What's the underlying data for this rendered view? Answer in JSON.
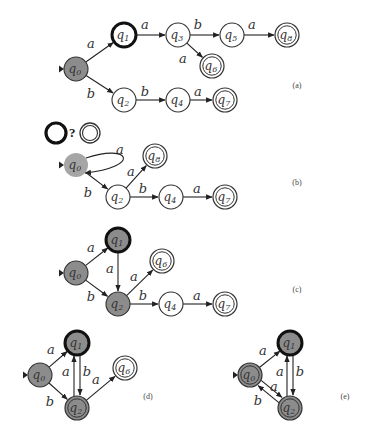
{
  "figure": {
    "colors": {
      "stroke": "#222222",
      "fill_white": "#ffffff",
      "fill_gray": "#8c8c8c",
      "fill_light_gray": "#a6a6a6",
      "text": "#333333"
    },
    "legend": {
      "thick_circle": "thick-bordered state",
      "question_mark": "?",
      "double_circle": "accepting state"
    },
    "panels": [
      {
        "id": "a",
        "label": "(a)",
        "label_pos": [
          297,
          88
        ],
        "nodes": [
          {
            "id": "q0",
            "name": "q",
            "sub": "0",
            "x": 76,
            "y": 69,
            "fill": "gray",
            "style": "normal",
            "initial": true
          },
          {
            "id": "q1",
            "name": "q",
            "sub": "1",
            "x": 124,
            "y": 35,
            "fill": "white",
            "style": "thick"
          },
          {
            "id": "q3",
            "name": "q",
            "sub": "3",
            "x": 178,
            "y": 35,
            "fill": "white",
            "style": "normal"
          },
          {
            "id": "q5",
            "name": "q",
            "sub": "5",
            "x": 232,
            "y": 35,
            "fill": "white",
            "style": "normal"
          },
          {
            "id": "q8",
            "name": "q",
            "sub": "8",
            "x": 287,
            "y": 35,
            "fill": "white",
            "style": "double"
          },
          {
            "id": "q6",
            "name": "q",
            "sub": "6",
            "x": 212,
            "y": 66,
            "fill": "white",
            "style": "double"
          },
          {
            "id": "q2",
            "name": "q",
            "sub": "2",
            "x": 124,
            "y": 100,
            "fill": "white",
            "style": "normal"
          },
          {
            "id": "q4",
            "name": "q",
            "sub": "4",
            "x": 178,
            "y": 100,
            "fill": "white",
            "style": "normal"
          },
          {
            "id": "q7",
            "name": "q",
            "sub": "7",
            "x": 225,
            "y": 100,
            "fill": "white",
            "style": "double"
          }
        ],
        "edges": [
          {
            "from": "q0",
            "to": "q1",
            "label": "a",
            "lx": 91,
            "ly": 48
          },
          {
            "from": "q1",
            "to": "q3",
            "label": "a",
            "lx": 145,
            "ly": 29
          },
          {
            "from": "q3",
            "to": "q5",
            "label": "b",
            "lx": 198,
            "ly": 29
          },
          {
            "from": "q5",
            "to": "q8",
            "label": "a",
            "lx": 252,
            "ly": 29
          },
          {
            "from": "q3",
            "to": "q6",
            "label": "a",
            "lx": 183,
            "ly": 63
          },
          {
            "from": "q0",
            "to": "q2",
            "label": "b",
            "lx": 91,
            "ly": 98
          },
          {
            "from": "q2",
            "to": "q4",
            "label": "b",
            "lx": 145,
            "ly": 96
          },
          {
            "from": "q4",
            "to": "q7",
            "label": "a",
            "lx": 198,
            "ly": 96
          }
        ]
      },
      {
        "id": "b",
        "label": "(b)",
        "label_pos": [
          297,
          185
        ],
        "nodes": [
          {
            "id": "q0",
            "name": "q",
            "sub": "0",
            "x": 76,
            "y": 165,
            "fill": "light_gray",
            "style": "none",
            "initial": true
          },
          {
            "id": "q8",
            "name": "q",
            "sub": "8",
            "x": 155,
            "y": 156,
            "fill": "white",
            "style": "double"
          },
          {
            "id": "q2",
            "name": "q",
            "sub": "2",
            "x": 118,
            "y": 197,
            "fill": "white",
            "style": "normal"
          },
          {
            "id": "q4",
            "name": "q",
            "sub": "4",
            "x": 171,
            "y": 197,
            "fill": "white",
            "style": "normal"
          },
          {
            "id": "q7",
            "name": "q",
            "sub": "7",
            "x": 225,
            "y": 197,
            "fill": "white",
            "style": "double"
          }
        ],
        "edges": [
          {
            "from": "q0",
            "to": "q0",
            "label": "a",
            "lx": 120,
            "ly": 154,
            "loop": true
          },
          {
            "from": "q0",
            "to": "q2",
            "label": "b",
            "lx": 88,
            "ly": 197
          },
          {
            "from": "q2",
            "to": "q8",
            "label": "a",
            "lx": 131,
            "ly": 176
          },
          {
            "from": "q2",
            "to": "q4",
            "label": "b",
            "lx": 143,
            "ly": 193
          },
          {
            "from": "q4",
            "to": "q7",
            "label": "a",
            "lx": 197,
            "ly": 193
          }
        ]
      },
      {
        "id": "c",
        "label": "(c)",
        "label_pos": [
          297,
          292
        ],
        "nodes": [
          {
            "id": "q0",
            "name": "q",
            "sub": "0",
            "x": 76,
            "y": 273,
            "fill": "gray",
            "style": "normal",
            "initial": true
          },
          {
            "id": "q1",
            "name": "q",
            "sub": "1",
            "x": 118,
            "y": 240,
            "fill": "gray",
            "style": "thick"
          },
          {
            "id": "q6",
            "name": "q",
            "sub": "6",
            "x": 162,
            "y": 261,
            "fill": "white",
            "style": "double"
          },
          {
            "id": "q2",
            "name": "q",
            "sub": "2",
            "x": 118,
            "y": 304,
            "fill": "gray",
            "style": "normal"
          },
          {
            "id": "q4",
            "name": "q",
            "sub": "4",
            "x": 171,
            "y": 304,
            "fill": "white",
            "style": "normal"
          },
          {
            "id": "q7",
            "name": "q",
            "sub": "7",
            "x": 225,
            "y": 304,
            "fill": "white",
            "style": "double"
          }
        ],
        "edges": [
          {
            "from": "q0",
            "to": "q1",
            "label": "a",
            "lx": 91,
            "ly": 252
          },
          {
            "from": "q1",
            "to": "q2",
            "label": "a",
            "lx": 110,
            "ly": 273
          },
          {
            "from": "q0",
            "to": "q2",
            "label": "b",
            "lx": 91,
            "ly": 301
          },
          {
            "from": "q2",
            "to": "q6",
            "label": "a",
            "lx": 134,
            "ly": 281
          },
          {
            "from": "q2",
            "to": "q4",
            "label": "b",
            "lx": 143,
            "ly": 300
          },
          {
            "from": "q4",
            "to": "q7",
            "label": "a",
            "lx": 197,
            "ly": 300
          }
        ]
      },
      {
        "id": "d",
        "label": "(d)",
        "label_pos": [
          148,
          399
        ],
        "nodes": [
          {
            "id": "q0",
            "name": "q",
            "sub": "0",
            "x": 40,
            "y": 375,
            "fill": "gray",
            "style": "normal",
            "initial": true
          },
          {
            "id": "q1",
            "name": "q",
            "sub": "1",
            "x": 77,
            "y": 343,
            "fill": "gray",
            "style": "thick"
          },
          {
            "id": "q6",
            "name": "q",
            "sub": "6",
            "x": 125,
            "y": 368,
            "fill": "white",
            "style": "double"
          },
          {
            "id": "q2",
            "name": "q",
            "sub": "2",
            "x": 77,
            "y": 408,
            "fill": "gray",
            "style": "double"
          }
        ],
        "edges": [
          {
            "from": "q0",
            "to": "q1",
            "label": "a",
            "lx": 51,
            "ly": 354
          },
          {
            "from": "q1",
            "to": "q2",
            "label": "a",
            "lx": 66,
            "ly": 376,
            "offset": -3
          },
          {
            "from": "q2",
            "to": "q1",
            "label": "b",
            "lx": 87,
            "ly": 376,
            "offset": -3
          },
          {
            "from": "q0",
            "to": "q2",
            "label": "b",
            "lx": 50,
            "ly": 406
          },
          {
            "from": "q2",
            "to": "q6",
            "label": "a",
            "lx": 96,
            "ly": 384
          }
        ]
      },
      {
        "id": "e",
        "label": "(e)",
        "label_pos": [
          345,
          399
        ],
        "nodes": [
          {
            "id": "q0",
            "name": "q",
            "sub": "0",
            "x": 250,
            "y": 375,
            "fill": "gray",
            "style": "double",
            "initial": true
          },
          {
            "id": "q1",
            "name": "q",
            "sub": "1",
            "x": 290,
            "y": 343,
            "fill": "gray",
            "style": "thick"
          },
          {
            "id": "q2",
            "name": "q",
            "sub": "2",
            "x": 290,
            "y": 408,
            "fill": "gray",
            "style": "double"
          }
        ],
        "edges": [
          {
            "from": "q0",
            "to": "q1",
            "label": "a",
            "lx": 263,
            "ly": 355
          },
          {
            "from": "q1",
            "to": "q2",
            "label": "a",
            "lx": 280,
            "ly": 376,
            "offset": -3
          },
          {
            "from": "q2",
            "to": "q1",
            "label": "b",
            "lx": 300,
            "ly": 376,
            "offset": -3
          },
          {
            "from": "q2",
            "to": "q0",
            "label": "a",
            "lx": 274,
            "ly": 391,
            "offset": -3
          },
          {
            "from": "q0",
            "to": "q2",
            "label": "b",
            "lx": 258,
            "ly": 405,
            "offset": -3
          }
        ]
      }
    ]
  }
}
